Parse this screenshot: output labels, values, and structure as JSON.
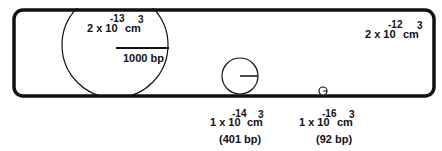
{
  "diagram": {
    "container": {
      "shape": "rounded-rectangle",
      "volume": {
        "coefficient": "2 x 10",
        "exponent": "-12",
        "unit": "cm",
        "unit_exponent": "3"
      }
    },
    "molecules": [
      {
        "size_label": "1000 bp",
        "volume": {
          "coefficient": "2 x 10",
          "exponent": "-13",
          "unit": "cm",
          "unit_exponent": "3"
        }
      },
      {
        "size_label": "(401 bp)",
        "volume": {
          "coefficient": "1 x 10",
          "exponent": "-14",
          "unit": "cm",
          "unit_exponent": "3"
        }
      },
      {
        "size_label": "(92 bp)",
        "volume": {
          "coefficient": "1 x 10",
          "exponent": "-16",
          "unit": "cm",
          "unit_exponent": "3"
        }
      }
    ]
  },
  "colors": {
    "stroke": "#111111",
    "background": "#ffffff"
  }
}
